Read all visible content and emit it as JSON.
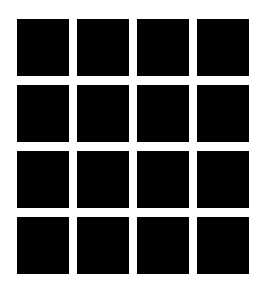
{
  "grid": {
    "rows": 4,
    "columns": 4,
    "cell_color": "#000000",
    "background_color": "#ffffff",
    "cells": [
      {
        "row": 1,
        "col": 1
      },
      {
        "row": 1,
        "col": 2
      },
      {
        "row": 1,
        "col": 3
      },
      {
        "row": 1,
        "col": 4
      },
      {
        "row": 2,
        "col": 1
      },
      {
        "row": 2,
        "col": 2
      },
      {
        "row": 2,
        "col": 3
      },
      {
        "row": 2,
        "col": 4
      },
      {
        "row": 3,
        "col": 1
      },
      {
        "row": 3,
        "col": 2
      },
      {
        "row": 3,
        "col": 3
      },
      {
        "row": 3,
        "col": 4
      },
      {
        "row": 4,
        "col": 1
      },
      {
        "row": 4,
        "col": 2
      },
      {
        "row": 4,
        "col": 3
      },
      {
        "row": 4,
        "col": 4
      }
    ]
  }
}
